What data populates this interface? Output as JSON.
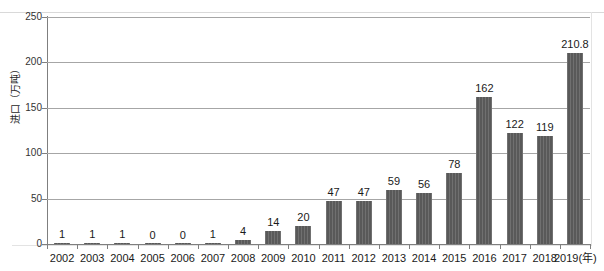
{
  "chart_data": {
    "type": "bar",
    "title": "",
    "subtitle": "",
    "xlabel": "",
    "ylabel": "进口（万吨）",
    "xaxis_unit_label": "(年)",
    "categories": [
      "2002",
      "2003",
      "2004",
      "2005",
      "2006",
      "2007",
      "2008",
      "2009",
      "2010",
      "2011",
      "2012",
      "2013",
      "2014",
      "2015",
      "2016",
      "2017",
      "2018",
      "2019"
    ],
    "category_display": [
      "2002",
      "2003",
      "2004",
      "2005",
      "2006",
      "2007",
      "2008",
      "2009",
      "2010",
      "2011",
      "2012",
      "2013",
      "2014",
      "2015",
      "2016",
      "2017",
      "2018",
      "2019(年)"
    ],
    "values": [
      1,
      1,
      1,
      0,
      0,
      1,
      4,
      14,
      20,
      47,
      47,
      59,
      56,
      78,
      162,
      122,
      119,
      210.8
    ],
    "value_labels": [
      "1",
      "1",
      "1",
      "0",
      "0",
      "1",
      "4",
      "14",
      "20",
      "47",
      "47",
      "59",
      "56",
      "78",
      "162",
      "122",
      "119",
      "210.8"
    ],
    "ylim": [
      0,
      250
    ],
    "yticks": [
      0,
      50,
      100,
      150,
      200,
      250
    ],
    "ytick_labels": [
      "0",
      "50",
      "100",
      "150",
      "200",
      "250"
    ],
    "grid": true,
    "grid_axis": "y",
    "legend": false,
    "legend_position": "none",
    "bar_color": "#595959",
    "gridline_color": "#a6a6a6",
    "axis_color": "#7f7f7f",
    "background": "#ffffff"
  }
}
